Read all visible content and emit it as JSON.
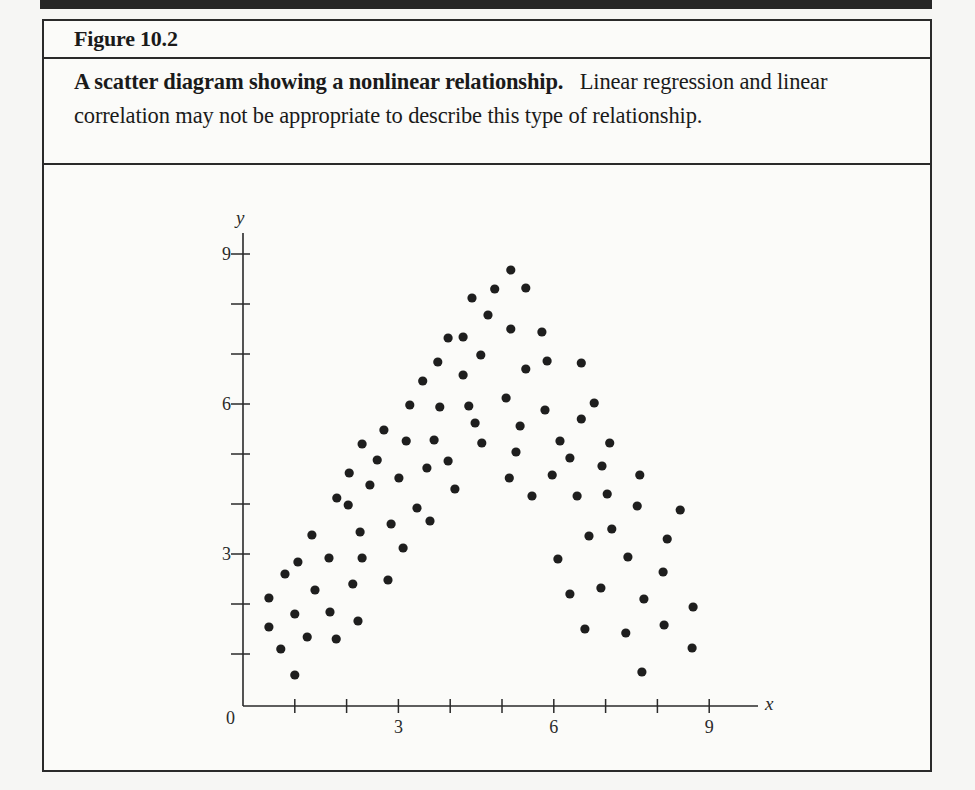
{
  "figure": {
    "label": "Figure 10.2",
    "caption_bold": "A scatter diagram showing a nonlinear relationship.",
    "caption_rest": "Linear regression and linear correlation may not be appropriate to describe this type of relationship."
  },
  "colors": {
    "frame": "#2a2a2a",
    "band": "#262626",
    "dot": "#1e1e1e",
    "background": "#fbfbf9"
  },
  "chart_data": {
    "type": "scatter",
    "title": "A scatter diagram showing a nonlinear relationship.",
    "xlabel": "x",
    "ylabel": "y",
    "xlim": [
      0,
      9.7
    ],
    "ylim": [
      0,
      9.4
    ],
    "x_ticks": [
      1,
      2,
      3,
      4,
      5,
      6,
      7,
      8,
      9
    ],
    "x_tick_labels": {
      "3": "3",
      "6": "6",
      "9": "9"
    },
    "y_ticks": [
      1,
      2,
      3,
      4,
      5,
      6,
      7,
      8,
      9
    ],
    "y_tick_labels": {
      "3": "3",
      "6": "6",
      "9": "9"
    },
    "origin_label": "0",
    "grid": false,
    "legend": null,
    "points": [
      [
        0.5,
        2.12
      ],
      [
        0.5,
        1.54
      ],
      [
        0.73,
        1.1
      ],
      [
        1.0,
        0.58
      ],
      [
        0.81,
        2.6
      ],
      [
        1.06,
        2.84
      ],
      [
        1.0,
        1.8
      ],
      [
        1.24,
        1.34
      ],
      [
        1.33,
        3.38
      ],
      [
        1.39,
        2.28
      ],
      [
        1.66,
        2.92
      ],
      [
        1.68,
        1.84
      ],
      [
        1.8,
        1.3
      ],
      [
        2.12,
        2.4
      ],
      [
        2.22,
        1.66
      ],
      [
        2.26,
        3.44
      ],
      [
        2.3,
        2.92
      ],
      [
        2.86,
        3.6
      ],
      [
        2.8,
        2.48
      ],
      [
        2.03,
        3.98
      ],
      [
        1.81,
        4.12
      ],
      [
        2.05,
        4.62
      ],
      [
        2.3,
        5.2
      ],
      [
        2.59,
        4.88
      ],
      [
        2.45,
        4.38
      ],
      [
        2.72,
        5.48
      ],
      [
        3.09,
        3.12
      ],
      [
        3.01,
        4.52
      ],
      [
        3.15,
        5.26
      ],
      [
        3.22,
        5.98
      ],
      [
        3.36,
        3.92
      ],
      [
        3.47,
        6.46
      ],
      [
        3.55,
        4.72
      ],
      [
        3.61,
        3.66
      ],
      [
        3.69,
        5.28
      ],
      [
        3.76,
        6.84
      ],
      [
        3.8,
        5.94
      ],
      [
        3.96,
        4.86
      ],
      [
        3.96,
        7.32
      ],
      [
        4.09,
        4.3
      ],
      [
        4.25,
        7.34
      ],
      [
        4.25,
        6.58
      ],
      [
        4.36,
        5.96
      ],
      [
        4.42,
        8.12
      ],
      [
        4.48,
        5.62
      ],
      [
        4.59,
        6.98
      ],
      [
        4.61,
        5.22
      ],
      [
        4.73,
        7.78
      ],
      [
        4.86,
        8.3
      ],
      [
        5.08,
        6.12
      ],
      [
        5.14,
        4.52
      ],
      [
        5.17,
        8.68
      ],
      [
        5.17,
        7.5
      ],
      [
        5.27,
        5.04
      ],
      [
        5.35,
        5.56
      ],
      [
        5.46,
        8.32
      ],
      [
        5.46,
        6.7
      ],
      [
        5.58,
        4.16
      ],
      [
        5.77,
        7.44
      ],
      [
        5.83,
        5.88
      ],
      [
        5.87,
        6.86
      ],
      [
        5.97,
        4.58
      ],
      [
        6.08,
        2.9
      ],
      [
        6.12,
        5.26
      ],
      [
        6.31,
        4.92
      ],
      [
        6.45,
        4.16
      ],
      [
        6.53,
        5.7
      ],
      [
        6.53,
        6.82
      ],
      [
        6.6,
        1.5
      ],
      [
        6.31,
        2.2
      ],
      [
        6.68,
        3.36
      ],
      [
        6.78,
        6.02
      ],
      [
        6.91,
        2.32
      ],
      [
        6.93,
        4.76
      ],
      [
        7.03,
        4.2
      ],
      [
        7.08,
        5.22
      ],
      [
        7.12,
        3.5
      ],
      [
        7.39,
        1.42
      ],
      [
        7.43,
        2.94
      ],
      [
        7.61,
        3.96
      ],
      [
        7.66,
        4.58
      ],
      [
        7.7,
        0.64
      ],
      [
        7.74,
        2.1
      ],
      [
        8.11,
        2.64
      ],
      [
        8.13,
        1.58
      ],
      [
        8.19,
        3.3
      ],
      [
        8.44,
        3.88
      ],
      [
        8.67,
        1.12
      ],
      [
        8.69,
        1.94
      ]
    ]
  }
}
